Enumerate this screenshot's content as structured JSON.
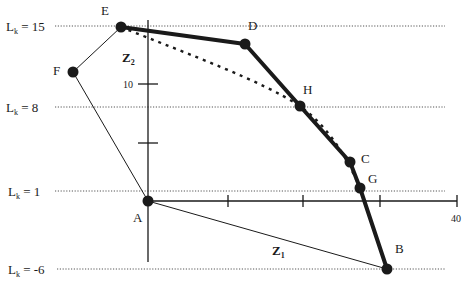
{
  "diagram": {
    "level_lines": [
      {
        "label": "L",
        "sub": "k",
        "value_text": " = 15",
        "y": 26
      },
      {
        "label": "L",
        "sub": "k",
        "value_text": " = 8",
        "y": 107
      },
      {
        "label": "L",
        "sub": "k",
        "value_text": " = 1",
        "y": 191
      },
      {
        "label": "L",
        "sub": "k",
        "value_text": " = -6",
        "y": 269
      }
    ],
    "axes": {
      "z1_label": "Z",
      "z1_sub": "1",
      "z2_label": "Z",
      "z2_sub": "2",
      "z2_tick_label": "10",
      "z1_tick_label": "40"
    },
    "points": [
      {
        "name": "A",
        "x": 148,
        "y": 201
      },
      {
        "name": "B",
        "x": 387,
        "y": 269
      },
      {
        "name": "C",
        "x": 350,
        "y": 162
      },
      {
        "name": "D",
        "x": 245,
        "y": 44
      },
      {
        "name": "E",
        "x": 121,
        "y": 27
      },
      {
        "name": "F",
        "x": 73,
        "y": 72
      },
      {
        "name": "G",
        "x": 360,
        "y": 188
      },
      {
        "name": "H",
        "x": 300,
        "y": 106
      }
    ],
    "point_labels": {
      "A": "A",
      "B": "B",
      "C": "C",
      "D": "D",
      "E": "E",
      "F": "F",
      "G": "G",
      "H": "H"
    },
    "colors": {
      "line": "#1a1a1a",
      "dotted": "#444444",
      "background": "#ffffff"
    }
  }
}
